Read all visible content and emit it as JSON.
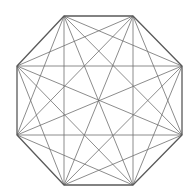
{
  "diagram": {
    "type": "complete-graph",
    "name": "K8 on regular octagon",
    "vertex_count": 8,
    "stroke_color": "#6e6e6e",
    "outline_color": "#5a5a5a",
    "background": "#ffffff",
    "vertices": [
      [
        64,
        16
      ],
      [
        133,
        16
      ],
      [
        182,
        66
      ],
      [
        182,
        135
      ],
      [
        133,
        185
      ],
      [
        64,
        185
      ],
      [
        17,
        135
      ],
      [
        17,
        66
      ]
    ]
  }
}
